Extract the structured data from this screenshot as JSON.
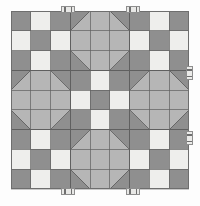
{
  "artwork": {
    "title": "Nine-Patch and Snowball Quilt Top",
    "kind": "quilt-block-layout",
    "canvas": {
      "width": 200,
      "height": 206
    },
    "background_color": "#fdfdfd",
    "surface": {
      "label": "quilt-top-surface",
      "x": 11,
      "y": 11,
      "width": 178,
      "height": 179,
      "fill_color": "#c9c9c9",
      "outline_color": "#6e6e6e"
    }
  },
  "palette": {
    "dark_gray": "#8f8f8f",
    "medium_gray": "#9b9b9b",
    "light_gray": "#b6b6b6",
    "cream": "#eeeeec",
    "off_white": "#e9e9e6",
    "seam_line": "#5f5f5f",
    "clip_fill": "#e8e8e6",
    "clip_edge": "#8e8e8e"
  },
  "layout": {
    "grid_rows": 3,
    "grid_cols": 3,
    "block_size": 59.3,
    "patch_divisions": 3,
    "blocks": [
      {
        "row": 0,
        "col": 0,
        "type": "nine-patch",
        "name": "block-top-left"
      },
      {
        "row": 0,
        "col": 1,
        "type": "snowball",
        "name": "block-top-center"
      },
      {
        "row": 0,
        "col": 2,
        "type": "nine-patch",
        "name": "block-top-right"
      },
      {
        "row": 1,
        "col": 0,
        "type": "snowball",
        "name": "block-middle-left"
      },
      {
        "row": 1,
        "col": 1,
        "type": "nine-patch",
        "name": "block-center"
      },
      {
        "row": 1,
        "col": 2,
        "type": "snowball",
        "name": "block-middle-right"
      },
      {
        "row": 2,
        "col": 0,
        "type": "nine-patch",
        "name": "block-bottom-left"
      },
      {
        "row": 2,
        "col": 1,
        "type": "snowball",
        "name": "block-bottom-center"
      },
      {
        "row": 2,
        "col": 2,
        "type": "nine-patch",
        "name": "block-bottom-right"
      }
    ],
    "nine_patch_pattern": [
      [
        "dark",
        "light",
        "dark"
      ],
      [
        "light",
        "dark",
        "light"
      ],
      [
        "dark",
        "light",
        "dark"
      ]
    ],
    "snowball_description": "Octagon of light gray centered in block with four corner triangles matching neighbouring nine-patch corner squares"
  },
  "binding_clips": [
    {
      "name": "clip-top-left",
      "edge": "top",
      "x": 61,
      "y": 6,
      "w": 14,
      "h": 7
    },
    {
      "name": "clip-top-right",
      "edge": "top",
      "x": 126,
      "y": 6,
      "w": 14,
      "h": 7
    },
    {
      "name": "clip-right-upper",
      "edge": "right",
      "x": 186,
      "y": 66,
      "w": 7,
      "h": 14
    },
    {
      "name": "clip-right-lower",
      "edge": "right",
      "x": 186,
      "y": 131,
      "w": 7,
      "h": 14
    },
    {
      "name": "clip-bottom-left",
      "edge": "bottom",
      "x": 61,
      "y": 188,
      "w": 14,
      "h": 7
    },
    {
      "name": "clip-bottom-right",
      "edge": "bottom",
      "x": 126,
      "y": 188,
      "w": 14,
      "h": 7
    }
  ],
  "measurements": {
    "zoom_label": "100%",
    "dimensions_label": "200 × 206"
  }
}
